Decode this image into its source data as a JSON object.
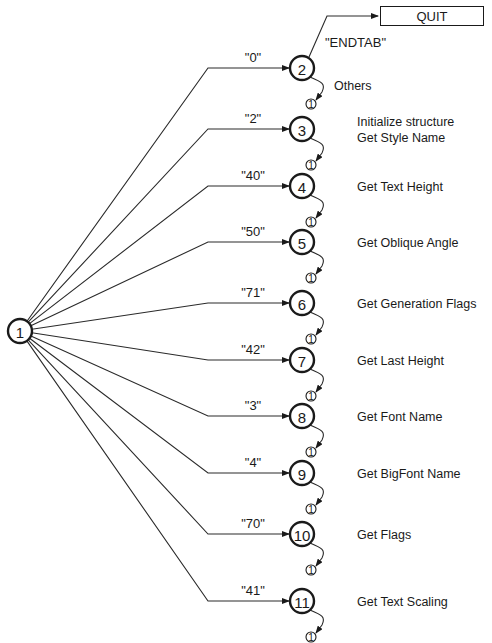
{
  "diagram": {
    "start_node": {
      "id": "1",
      "x": 20,
      "y": 331
    },
    "knee_x": 208,
    "node_x": 302,
    "quit": {
      "label": "QUIT",
      "condition": "\"ENDTAB\""
    },
    "others_label": "Others",
    "return_node_label": "1",
    "edges": [
      {
        "code": "\"0\"",
        "target": "2",
        "y": 68,
        "action": ""
      },
      {
        "code": "\"2\"",
        "target": "3",
        "y": 129,
        "action": "Initialize structure\nGet Style Name"
      },
      {
        "code": "\"40\"",
        "target": "4",
        "y": 186,
        "action": "Get Text Height"
      },
      {
        "code": "\"50\"",
        "target": "5",
        "y": 242,
        "action": "Get Oblique Angle"
      },
      {
        "code": "\"71\"",
        "target": "6",
        "y": 303,
        "action": "Get Generation Flags"
      },
      {
        "code": "\"42\"",
        "target": "7",
        "y": 360,
        "action": "Get Last Height"
      },
      {
        "code": "\"3\"",
        "target": "8",
        "y": 416,
        "action": "Get Font Name"
      },
      {
        "code": "\"4\"",
        "target": "9",
        "y": 473,
        "action": "Get BigFont Name"
      },
      {
        "code": "\"70\"",
        "target": "10",
        "y": 534,
        "action": "Get Flags"
      },
      {
        "code": "\"41\"",
        "target": "11",
        "y": 601,
        "action": "Get Text Scaling"
      }
    ]
  },
  "labels": {
    "quit": "QUIT",
    "endtab": "\"ENDTAB\"",
    "others": "Others",
    "edge_codes": [
      "\"0\"",
      "\"2\"",
      "\"40\"",
      "\"50\"",
      "\"71\"",
      "\"42\"",
      "\"3\"",
      "\"4\"",
      "\"70\"",
      "\"41\""
    ],
    "actions": [
      "Initialize structure",
      "Get Style Name",
      "Get Text Height",
      "Get Oblique Angle",
      "Get Generation Flags",
      "Get Last Height",
      "Get Font Name",
      "Get BigFont Name",
      "Get Flags",
      "Get Text Scaling"
    ]
  }
}
